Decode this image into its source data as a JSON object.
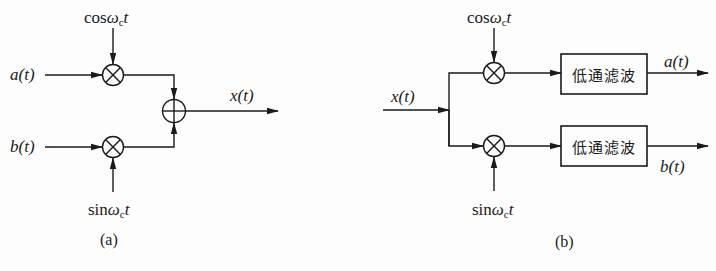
{
  "panel_a": {
    "caption": "(a)",
    "inputs": {
      "a": "a(t)",
      "b": "b(t)"
    },
    "carriers": {
      "cos": {
        "prefix": "cos",
        "omega": "ω",
        "sub": "c",
        "t": "t"
      },
      "sin": {
        "prefix": "sin",
        "omega": "ω",
        "sub": "c",
        "t": "t"
      }
    },
    "output": "x(t)",
    "nodes": [
      "multiplier",
      "multiplier",
      "adder"
    ]
  },
  "panel_b": {
    "caption": "(b)",
    "input": "x(t)",
    "carriers": {
      "cos": {
        "prefix": "cos",
        "omega": "ω",
        "sub": "c",
        "t": "t"
      },
      "sin": {
        "prefix": "sin",
        "omega": "ω",
        "sub": "c",
        "t": "t"
      }
    },
    "filters": [
      {
        "label": "低通滤波"
      },
      {
        "label": "低通滤波"
      }
    ],
    "outputs": {
      "a": "a(t)",
      "b": "b(t)"
    }
  },
  "colors": {
    "stroke": "#1a1a1a",
    "background": "#fdfdfd"
  }
}
